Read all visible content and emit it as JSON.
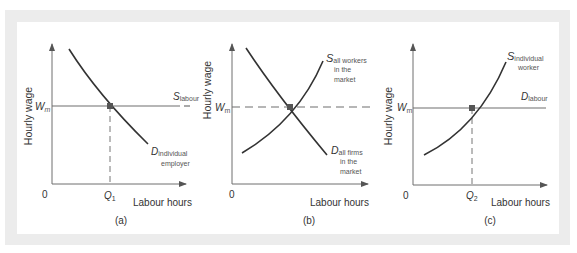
{
  "figure": {
    "panels": [
      {
        "id": "a",
        "caption": "(a)",
        "y_axis_label": "Hourly wage",
        "x_axis_label": "Labour hours",
        "origin_label": "0",
        "wage_label": "W",
        "wage_sub": "m",
        "quantity_label": "Q",
        "quantity_sub": "1",
        "supply_label": "S",
        "supply_sub": "labour",
        "demand_label": "D",
        "demand_sub_line1": "individual",
        "demand_sub_line2": "employer"
      },
      {
        "id": "b",
        "caption": "(b)",
        "y_axis_label": "Hourly wage",
        "x_axis_label": "Labour hours",
        "origin_label": "0",
        "wage_label": "W",
        "wage_sub": "m",
        "supply_label": "S",
        "supply_sub_line1": "all workers",
        "supply_sub_line2": "in the",
        "supply_sub_line3": "market",
        "demand_label": "D",
        "demand_sub_line1": "all firms",
        "demand_sub_line2": "in the",
        "demand_sub_line3": "market"
      },
      {
        "id": "c",
        "caption": "(c)",
        "y_axis_label": "Hourly wage",
        "x_axis_label": "Labour hours",
        "origin_label": "0",
        "wage_label": "W",
        "wage_sub": "m",
        "quantity_label": "Q",
        "quantity_sub": "2",
        "supply_label": "S",
        "supply_sub_line1": "individual",
        "supply_sub_line2": "worker",
        "demand_label": "D",
        "demand_sub": "labour"
      }
    ],
    "colors": {
      "curve": "#333333",
      "axis": "#6f6f6f",
      "frame": "#ececec",
      "marker": "#555555"
    }
  }
}
